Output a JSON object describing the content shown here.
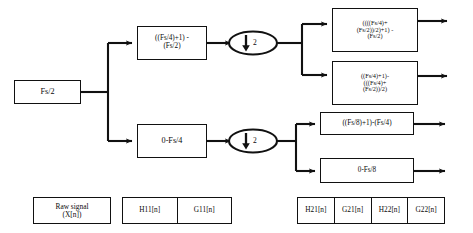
{
  "diagram": {
    "colors": {
      "stroke": "#111111",
      "fill": "#ffffff",
      "text": "#0a0a0a"
    },
    "input": {
      "label": "Fs/2"
    },
    "level1": {
      "highband": {
        "label": "((Fs/4)+1) -\n(Fs/2)"
      },
      "lowband": {
        "label": "0-Fs/4"
      },
      "decimator_top": {
        "factor": "2",
        "symbol": "downsample-arrow"
      },
      "decimator_bottom": {
        "factor": "2",
        "symbol": "downsample-arrow"
      }
    },
    "level2": {
      "band_a": {
        "label": "((((Fs/4)+\n(Fs/2))/2)+1) -\n(Fs/2)"
      },
      "band_b": {
        "label": "((Fs/4)+1)-\n(((Fs/4)+\n(Fs/2))/2)"
      },
      "band_c": {
        "label": "((Fs/8)+1)-(Fs/4)"
      },
      "band_d": {
        "label": "0-Fs/8"
      }
    },
    "legend": {
      "raw_signal": {
        "label": "Raw signal\n(X[n])"
      },
      "level1_strip": {
        "cells": [
          "H11[n]",
          "G11[n]"
        ]
      },
      "level2_strip": {
        "cells": [
          "H21[n]",
          "G21[n]",
          "H22[n]",
          "G22[n]"
        ]
      }
    }
  }
}
